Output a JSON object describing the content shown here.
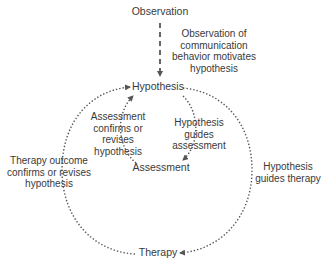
{
  "nodes": {
    "observation": "Observation",
    "hypothesis": "Hypothesis",
    "assessment": "Assessment",
    "therapy": "Therapy"
  },
  "edges": {
    "observation_to_hypothesis": {
      "line1": "Observation of",
      "line2": "communication",
      "line3": "behavior motivates",
      "line4": "hypothesis",
      "style": "dashed"
    },
    "assessment_to_hypothesis": {
      "line1": "Assessment",
      "line2": "confirms or",
      "line3": "revises",
      "line4": "hypothesis",
      "style": "dotted"
    },
    "hypothesis_to_assessment": {
      "line1": "Hypothesis",
      "line2": "guides",
      "line3": "assessment",
      "style": "dotted"
    },
    "therapy_to_hypothesis": {
      "line1": "Therapy outcome",
      "line2": "confirms or revises",
      "line3": "hypothesis",
      "style": "dotted"
    },
    "hypothesis_to_therapy": {
      "line1": "Hypothesis",
      "line2": "guides therapy",
      "style": "dotted"
    }
  },
  "colors": {
    "text": "#3a3a3a",
    "line": "#555555",
    "background": "#ffffff"
  }
}
